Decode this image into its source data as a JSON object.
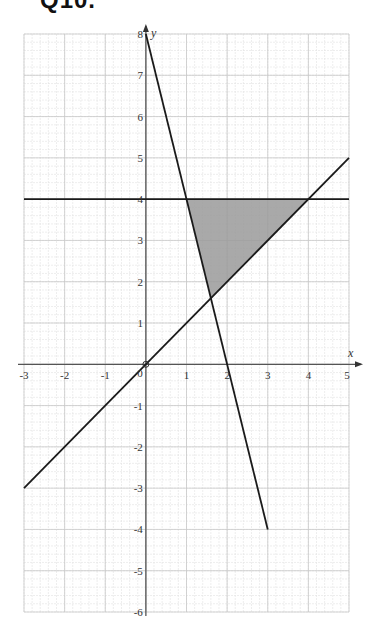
{
  "header": {
    "title": "Q10."
  },
  "chart_data": {
    "type": "line",
    "title": "Q10.",
    "xlabel": "x",
    "ylabel": "y",
    "xlim": [
      -3,
      5
    ],
    "ylim": [
      -6,
      8
    ],
    "grid": true,
    "grid_minor_per_unit": 5,
    "x_ticks": [
      "-3",
      "-2",
      "-1",
      "0",
      "1",
      "2",
      "3",
      "4",
      "5"
    ],
    "y_ticks": [
      "8",
      "7",
      "6",
      "5",
      "4",
      "3",
      "2",
      "1",
      "-1",
      "-2",
      "-3",
      "-4",
      "-5",
      "-6"
    ],
    "series": [
      {
        "name": "y = 8 - 4x",
        "points": [
          [
            0,
            8
          ],
          [
            3,
            -4
          ]
        ]
      },
      {
        "name": "y = x",
        "points": [
          [
            -3,
            -3
          ],
          [
            5,
            5
          ]
        ]
      },
      {
        "name": "y = 4",
        "points": [
          [
            -3,
            4
          ],
          [
            5,
            4
          ]
        ]
      }
    ],
    "shaded_region": {
      "vertices": [
        [
          1,
          4
        ],
        [
          4,
          4
        ],
        [
          1.6,
          1.6
        ]
      ],
      "color": "#9a9a9a"
    },
    "colors": {
      "line": "#1a1a1a",
      "grid": "#d4d4d4",
      "axis": "#555555"
    }
  }
}
